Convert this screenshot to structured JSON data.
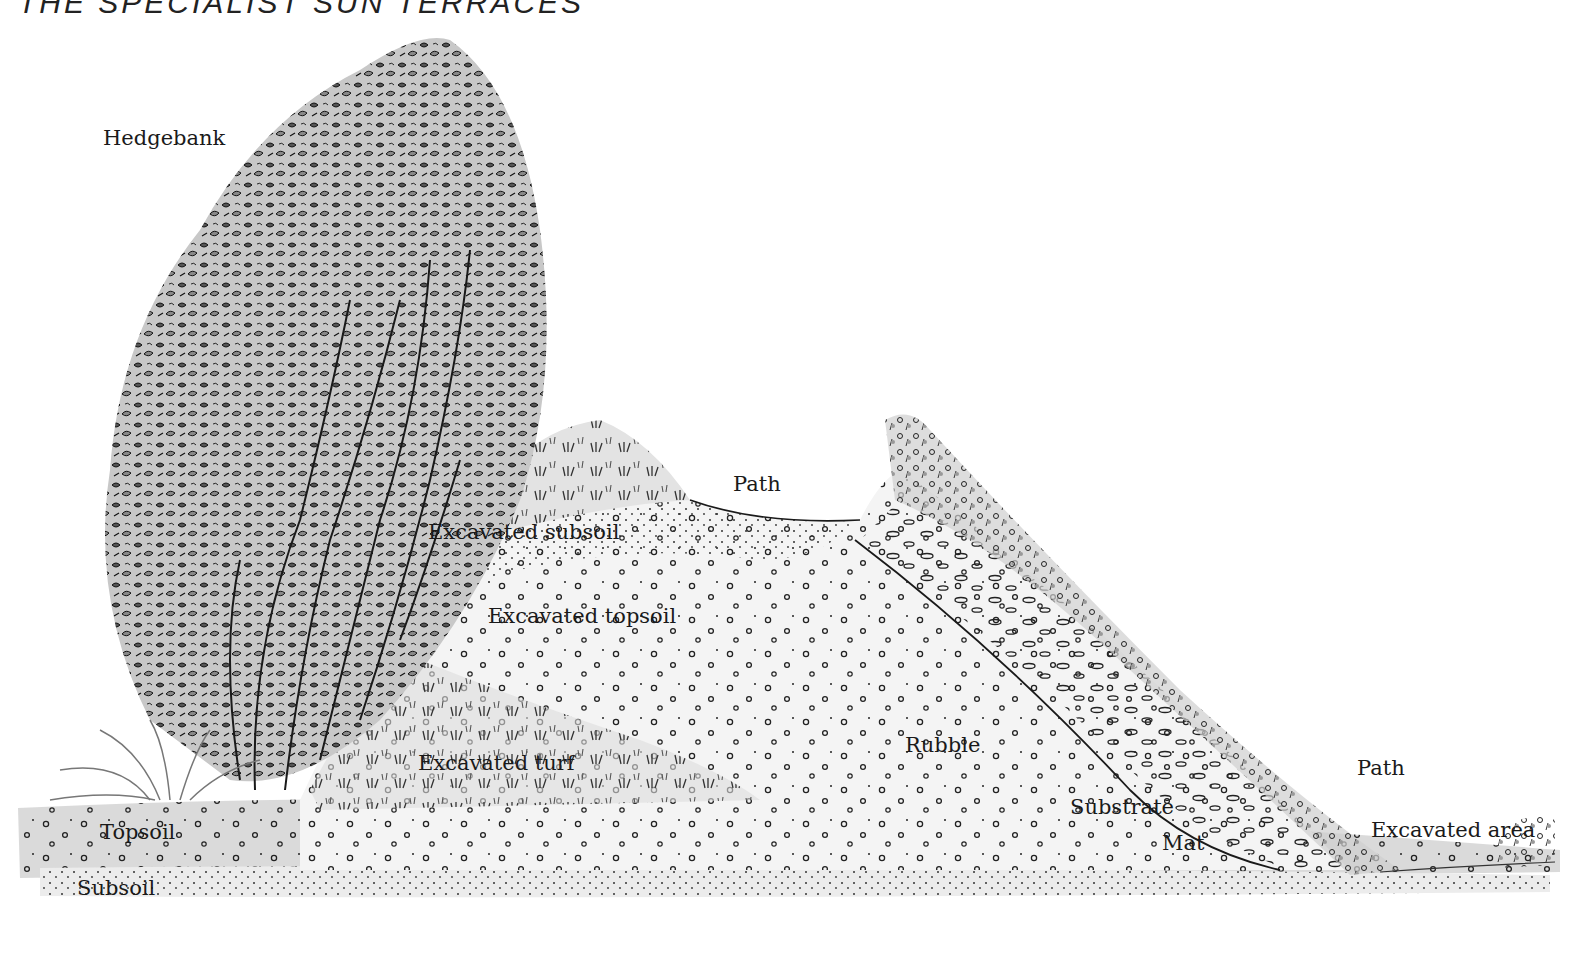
{
  "header": {
    "text": "THE SPECIALIST SUN TERRACES"
  },
  "diagram": {
    "type": "cross-section illustration",
    "labels": [
      {
        "id": "hedgebank",
        "text": "Hedgebank",
        "x": 103,
        "y": 128
      },
      {
        "id": "path-top",
        "text": "Path",
        "x": 733,
        "y": 474
      },
      {
        "id": "excavated-subsoil",
        "text": "Excavated subsoil",
        "x": 428,
        "y": 522
      },
      {
        "id": "excavated-topsoil",
        "text": "Excavated topsoil",
        "x": 488,
        "y": 606
      },
      {
        "id": "rubble",
        "text": "Rubble",
        "x": 905,
        "y": 735
      },
      {
        "id": "excavated-turf",
        "text": "Excavated turf",
        "x": 418,
        "y": 753
      },
      {
        "id": "path-right",
        "text": "Path",
        "x": 1357,
        "y": 758
      },
      {
        "id": "substrate",
        "text": "Substrate",
        "x": 1070,
        "y": 797
      },
      {
        "id": "excavated-area",
        "text": "Excavated area",
        "x": 1371,
        "y": 820
      },
      {
        "id": "topsoil",
        "text": "Topsoil",
        "x": 100,
        "y": 822
      },
      {
        "id": "mat",
        "text": "Mat",
        "x": 1162,
        "y": 833
      },
      {
        "id": "subsoil",
        "text": "Subsoil",
        "x": 77,
        "y": 878
      }
    ]
  },
  "colors": {
    "ink": "#1a1a1a",
    "wash_light": "#e6e6e6",
    "wash_mid": "#cfcfcf",
    "wash_dark": "#9a9a9a",
    "background": "#ffffff"
  }
}
